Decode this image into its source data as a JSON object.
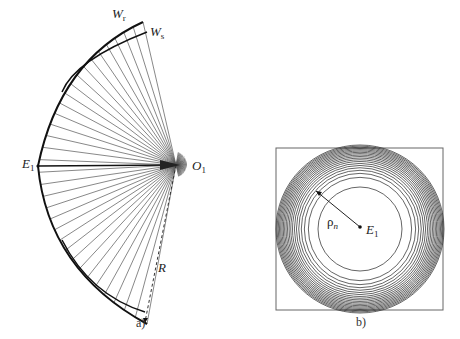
{
  "panel_a": {
    "caption": "a)",
    "labels": {
      "wr": "W",
      "wr_sub": "r",
      "ws": "W",
      "ws_sub": "s",
      "e1": "E",
      "e1_sub": "1",
      "o1": "O",
      "o1_sub": "1",
      "r": "R"
    },
    "ray_count": 34
  },
  "panel_b": {
    "caption": "b)",
    "labels": {
      "rho": "ρ",
      "rho_sub": "n",
      "e1": "E",
      "e1_sub": "1"
    },
    "ring_count": 20
  },
  "colors": {
    "ink": "#222222",
    "ray": "#555555",
    "frame": "#666666"
  }
}
